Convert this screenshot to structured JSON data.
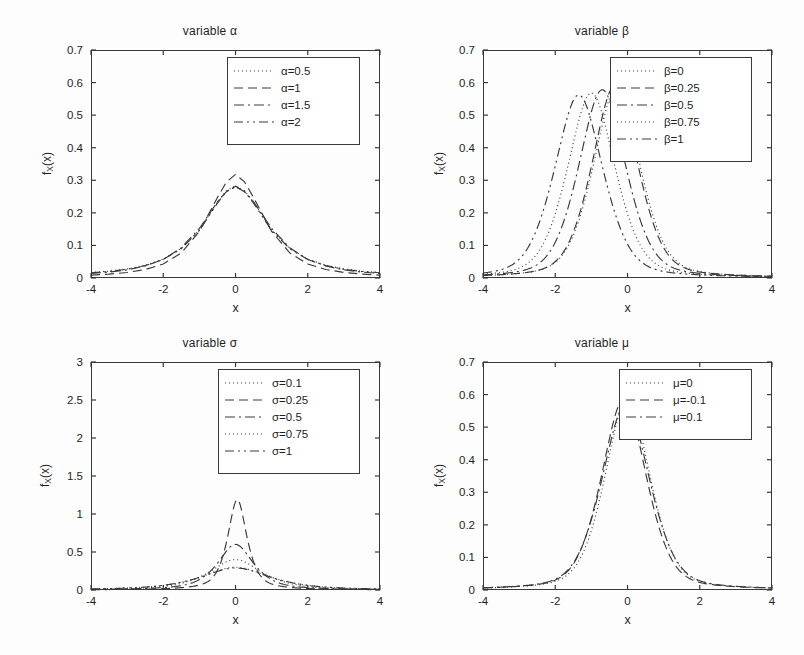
{
  "figure": {
    "background": "#fdfdfd",
    "ink": "#3a3a3a"
  },
  "panels": [
    {
      "id": "alpha",
      "title": "variable α",
      "xlabel": "x",
      "ylabel_main": "f",
      "ylabel_sub": "X",
      "ylabel_tail": "(x)",
      "xticks": [
        "-4",
        "-2",
        "0",
        "2",
        "4"
      ],
      "yticks": [
        "0",
        "0.1",
        "0.2",
        "0.3",
        "0.4",
        "0.5",
        "0.6",
        "0.7"
      ],
      "legend": [
        {
          "label": "α=0.5",
          "style": "dotted"
        },
        {
          "label": "α=1",
          "style": "dashed"
        },
        {
          "label": "α=1.5",
          "style": "dashdot"
        },
        {
          "label": "α=2",
          "style": "dashdotdot"
        }
      ]
    },
    {
      "id": "beta",
      "title": "variable β",
      "xlabel": "x",
      "ylabel_main": "f",
      "ylabel_sub": "X",
      "ylabel_tail": "(x)",
      "xticks": [
        "-4",
        "-2",
        "0",
        "2",
        "4"
      ],
      "yticks": [
        "0",
        "0.1",
        "0.2",
        "0.3",
        "0.4",
        "0.5",
        "0.6",
        "0.7"
      ],
      "legend": [
        {
          "label": "β=0",
          "style": "dotted"
        },
        {
          "label": "β=0.25",
          "style": "dashed"
        },
        {
          "label": "β=0.5",
          "style": "dashdot"
        },
        {
          "label": "β=0.75",
          "style": "dotted"
        },
        {
          "label": "β=1",
          "style": "dashdotdot"
        }
      ]
    },
    {
      "id": "sigma",
      "title": "variable σ",
      "xlabel": "x",
      "ylabel_main": "f",
      "ylabel_sub": "X",
      "ylabel_tail": "(x)",
      "xticks": [
        "-4",
        "-2",
        "0",
        "2",
        "4"
      ],
      "yticks": [
        "0",
        "0.5",
        "1",
        "1.5",
        "2",
        "2.5",
        "3"
      ],
      "legend": [
        {
          "label": "σ=0.1",
          "style": "dotted"
        },
        {
          "label": "σ=0.25",
          "style": "dashed"
        },
        {
          "label": "σ=0.5",
          "style": "dashdot"
        },
        {
          "label": "σ=0.75",
          "style": "dotted"
        },
        {
          "label": "σ=1",
          "style": "dashdotdot"
        }
      ]
    },
    {
      "id": "mu",
      "title": "variable μ",
      "xlabel": "x",
      "ylabel_main": "f",
      "ylabel_sub": "X",
      "ylabel_tail": "(x)",
      "xticks": [
        "-4",
        "-2",
        "0",
        "2",
        "4"
      ],
      "yticks": [
        "0",
        "0.1",
        "0.2",
        "0.3",
        "0.4",
        "0.5",
        "0.6",
        "0.7"
      ],
      "legend": [
        {
          "label": "μ=0",
          "style": "dotted"
        },
        {
          "label": "μ=-0.1",
          "style": "dashed"
        },
        {
          "label": "μ=0.1",
          "style": "dashdot"
        }
      ]
    }
  ],
  "chart_data": [
    {
      "type": "line",
      "title": "variable α",
      "xlabel": "x",
      "ylabel": "f_X(x)",
      "xlim": [
        -4,
        4
      ],
      "ylim": [
        0,
        0.7
      ],
      "xticks": [
        -4,
        -2,
        0,
        2,
        4
      ],
      "yticks": [
        0,
        0.1,
        0.2,
        0.3,
        0.4,
        0.5,
        0.6,
        0.7
      ],
      "grid": false,
      "legend_position": "upper right",
      "x": [
        -4,
        -3.5,
        -3,
        -2.5,
        -2,
        -1.5,
        -1,
        -0.5,
        -0.25,
        0,
        0.25,
        0.5,
        1,
        1.5,
        2,
        2.5,
        3,
        3.5,
        4
      ],
      "series": [
        {
          "name": "α=0.5",
          "style": "dotted",
          "values": [
            0.017,
            0.021,
            0.028,
            0.039,
            0.058,
            0.091,
            0.148,
            0.233,
            0.268,
            0.283,
            0.268,
            0.233,
            0.148,
            0.091,
            0.058,
            0.039,
            0.028,
            0.021,
            0.017
          ]
        },
        {
          "name": "α=1",
          "style": "dashed",
          "values": [
            0.009,
            0.012,
            0.017,
            0.026,
            0.043,
            0.077,
            0.143,
            0.247,
            0.295,
            0.318,
            0.295,
            0.247,
            0.143,
            0.077,
            0.043,
            0.026,
            0.017,
            0.012,
            0.009
          ]
        },
        {
          "name": "α=1.5",
          "style": "dashdot",
          "values": [
            0.014,
            0.018,
            0.025,
            0.037,
            0.057,
            0.093,
            0.152,
            0.234,
            0.265,
            0.28,
            0.265,
            0.234,
            0.152,
            0.093,
            0.057,
            0.037,
            0.025,
            0.018,
            0.014
          ]
        },
        {
          "name": "α=2",
          "style": "dashdotdot",
          "values": [
            0.016,
            0.02,
            0.027,
            0.038,
            0.057,
            0.09,
            0.146,
            0.23,
            0.266,
            0.282,
            0.266,
            0.23,
            0.146,
            0.09,
            0.057,
            0.038,
            0.027,
            0.02,
            0.016
          ]
        }
      ]
    },
    {
      "type": "line",
      "title": "variable β",
      "xlabel": "x",
      "ylabel": "f_X(x)",
      "xlim": [
        -4,
        4
      ],
      "ylim": [
        0,
        0.7
      ],
      "xticks": [
        -4,
        -2,
        0,
        2,
        4
      ],
      "yticks": [
        0,
        0.1,
        0.2,
        0.3,
        0.4,
        0.5,
        0.6,
        0.7
      ],
      "grid": false,
      "legend_position": "upper right",
      "peaks": [
        {
          "name": "β=0",
          "peak_x": -0.3,
          "peak_y": 0.585
        },
        {
          "name": "β=0.25",
          "peak_x": -0.35,
          "peak_y": 0.59
        },
        {
          "name": "β=0.5",
          "peak_x": -0.7,
          "peak_y": 0.578
        },
        {
          "name": "β=0.75",
          "peak_x": -1.0,
          "peak_y": 0.568
        },
        {
          "name": "β=1",
          "peak_x": -1.35,
          "peak_y": 0.562
        }
      ],
      "series": [
        {
          "name": "β=0",
          "style": "dotted",
          "mean": -0.3,
          "peak": 0.585,
          "width": 0.68
        },
        {
          "name": "β=0.25",
          "style": "dashed",
          "mean": -0.35,
          "peak": 0.59,
          "width": 0.67
        },
        {
          "name": "β=0.5",
          "style": "dashdot",
          "mean": -0.7,
          "peak": 0.578,
          "width": 0.69
        },
        {
          "name": "β=0.75",
          "style": "dotted",
          "mean": -1.0,
          "peak": 0.568,
          "width": 0.7
        },
        {
          "name": "β=1",
          "style": "dashdotdot",
          "mean": -1.35,
          "peak": 0.562,
          "width": 0.71
        }
      ]
    },
    {
      "type": "line",
      "title": "variable σ",
      "xlabel": "x",
      "ylabel": "f_X(x)",
      "xlim": [
        -4,
        4
      ],
      "ylim": [
        0,
        3
      ],
      "xticks": [
        -4,
        -2,
        0,
        2,
        4
      ],
      "yticks": [
        0,
        0.5,
        1,
        1.5,
        2,
        2.5,
        3
      ],
      "grid": false,
      "legend_position": "upper right",
      "series": [
        {
          "name": "σ=0.1",
          "style": "dotted",
          "peak": 0.3,
          "peak_x": 0.0,
          "width": 1.05
        },
        {
          "name": "σ=0.25",
          "style": "dashed",
          "peak": 1.19,
          "peak_x": 0.05,
          "width": 0.3
        },
        {
          "name": "σ=0.5",
          "style": "dashdot",
          "peak": 0.6,
          "peak_x": 0.0,
          "width": 0.56
        },
        {
          "name": "σ=0.75",
          "style": "dotted",
          "peak": 0.4,
          "peak_x": 0.0,
          "width": 0.82
        },
        {
          "name": "σ=1",
          "style": "dashdotdot",
          "peak": 0.29,
          "peak_x": 0.0,
          "width": 1.08
        }
      ]
    },
    {
      "type": "line",
      "title": "variable μ",
      "xlabel": "x",
      "ylabel": "f_X(x)",
      "xlim": [
        -4,
        4
      ],
      "ylim": [
        0,
        0.7
      ],
      "xticks": [
        -4,
        -2,
        0,
        2,
        4
      ],
      "yticks": [
        0,
        0.1,
        0.2,
        0.3,
        0.4,
        0.5,
        0.6,
        0.7
      ],
      "grid": false,
      "legend_position": "upper right",
      "series": [
        {
          "name": "μ=0",
          "style": "dotted",
          "peak": 0.588,
          "peak_x": 0.0,
          "width": 0.66
        },
        {
          "name": "μ=-0.1",
          "style": "dashed",
          "peak": 0.586,
          "peak_x": -0.1,
          "width": 0.66
        },
        {
          "name": "μ=0.1",
          "style": "dashdot",
          "peak": 0.57,
          "peak_x": -0.05,
          "width": 0.7
        }
      ]
    }
  ]
}
